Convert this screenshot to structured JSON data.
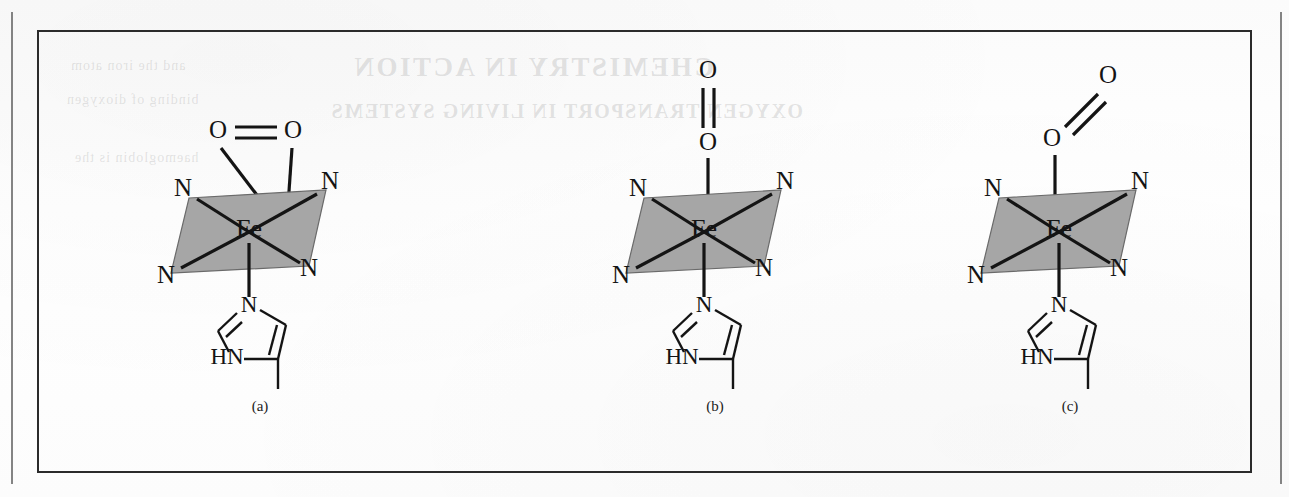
{
  "figure": {
    "caption_a": "(a)",
    "caption_b": "(b)",
    "caption_c": "(c)",
    "frame_color": "#2b2b2b",
    "plane_fill_color": "#a6a6a6",
    "bond_color": "#141414",
    "background_color": "#fdfdfd"
  },
  "showthrough": {
    "title": "CHEMISTRY IN ACTION",
    "subtitle": "OXYGEN TRANSPORT IN LIVING SYSTEMS",
    "line1": "and the iron atom",
    "line2": "binding of dioxygen",
    "line3": "haemoglobin is the"
  },
  "structures": [
    {
      "id": "a",
      "label": "(a)",
      "binding_mode": "side-on",
      "metal": "Fe",
      "oxygen_top": "O",
      "oxygen_bottom": "O",
      "oo_bond_order": "double",
      "plane_donors": [
        "N",
        "N",
        "N",
        "N"
      ],
      "axial_ligand": "imidazole",
      "imidazole": {
        "n_top": "N",
        "nh": "HN"
      }
    },
    {
      "id": "b",
      "label": "(b)",
      "binding_mode": "end-on linear",
      "metal": "Fe",
      "oxygen_top": "O",
      "oxygen_bottom": "O",
      "oo_bond_order": "double",
      "plane_donors": [
        "N",
        "N",
        "N",
        "N"
      ],
      "axial_ligand": "imidazole",
      "imidazole": {
        "n_top": "N",
        "nh": "HN"
      }
    },
    {
      "id": "c",
      "label": "(c)",
      "binding_mode": "end-on bent",
      "metal": "Fe",
      "oxygen_top": "O",
      "oxygen_bottom": "O",
      "oo_bond_order": "double",
      "plane_donors": [
        "N",
        "N",
        "N",
        "N"
      ],
      "axial_ligand": "imidazole",
      "imidazole": {
        "n_top": "N",
        "nh": "HN"
      }
    }
  ]
}
